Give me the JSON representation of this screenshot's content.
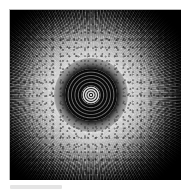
{
  "page": {
    "background_color": "#ffffff",
    "width": 181,
    "height": 192
  },
  "figure": {
    "panel_background_color": "#000000",
    "border_color": "#b9b9b9",
    "alt_description": "Grayscale radially symmetric diffraction pattern",
    "palette": "grayscale",
    "core": {
      "name": "dark-concentric-core",
      "center_x_pct": 47.5,
      "center_y_pct": 50,
      "ring_colors": [
        "#080808",
        "#6e6e6e",
        "#111111"
      ],
      "inner_bright_core_color": "#d8d8d8"
    },
    "halo": {
      "name": "bright-scattering-halo",
      "highlight_color": "#ffffff",
      "falloff_color": "#000000",
      "texture": "speckled-radial-filaments"
    }
  },
  "caption": {
    "bar_color": "#e4e4e4",
    "text": ""
  }
}
